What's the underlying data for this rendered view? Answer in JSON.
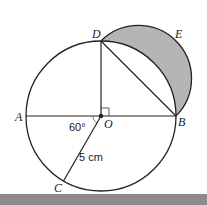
{
  "diagram": {
    "points": {
      "A": {
        "label": "A"
      },
      "B": {
        "label": "B"
      },
      "C": {
        "label": "C"
      },
      "D": {
        "label": "D"
      },
      "E": {
        "label": "E"
      },
      "O": {
        "label": "O"
      }
    },
    "annotations": {
      "angle_AOC": "60°",
      "radius_OC": "5 cm",
      "right_angle_DOB": "right-angle marker"
    },
    "shaded_region": "Lune between semicircle DEB and arc DB",
    "colors": {
      "stroke": "#222222",
      "shade": "#b5b5b5",
      "bottom_bar": "#8c8c8c"
    }
  }
}
